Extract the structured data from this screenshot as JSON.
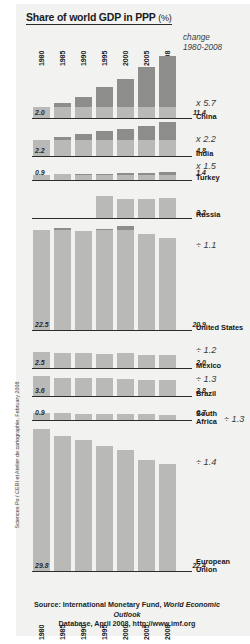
{
  "title": {
    "main": "Share of world GDP in PPP",
    "unit": "(%)"
  },
  "change_header": {
    "line1": "change",
    "line2": "1980-2008"
  },
  "source": {
    "line1_a": "Source: International Monetary Fund, ",
    "line1_b": "World Economic Outlook",
    "line2": "Database, April 2008, http://www.imf.org"
  },
  "credit": "Sciences Po / CERI et Atelier de cartographie, February 2008",
  "colors": {
    "panel": "#f2f2f0",
    "bar": "#b9b9b7",
    "bar_cap": "#8d8d8b",
    "baseline": "#2c2c2c",
    "text": "#141414"
  },
  "chart_data": {
    "type": "bar",
    "title": "Share of world GDP in PPP (%)",
    "xlabel": "",
    "ylabel": "Share of world GDP in PPP (%)",
    "grid": false,
    "legend_position": "none",
    "categories": [
      "1980",
      "1985",
      "1990",
      "1995",
      "2000",
      "2005",
      "2008"
    ],
    "annotation_header": "change 1980-2008",
    "series": [
      {
        "name": "China",
        "values": [
          2.0,
          2.8,
          3.9,
          5.7,
          7.1,
          9.4,
          11.4
        ],
        "start_label": "2.0",
        "end_label": "11.4",
        "change": "x 5.7",
        "change_kind": "increase"
      },
      {
        "name": "India",
        "values": [
          2.2,
          2.7,
          3.1,
          3.5,
          3.8,
          4.3,
          4.8
        ],
        "start_label": "2.2",
        "end_label": "4.8",
        "change": "x 2.2",
        "change_kind": "increase"
      },
      {
        "name": "Turkey",
        "values": [
          0.9,
          1.0,
          1.1,
          1.1,
          1.2,
          1.3,
          1.4
        ],
        "start_label": "0.9",
        "end_label": "1.4",
        "change": "x 1.5",
        "change_kind": "increase"
      },
      {
        "name": "Russia",
        "values": [
          null,
          null,
          null,
          3.6,
          3.1,
          3.1,
          3.2
        ],
        "start_label": "",
        "end_label": "3.2",
        "change": "",
        "change_kind": "none"
      },
      {
        "name": "United States",
        "values": [
          22.5,
          23.0,
          22.4,
          22.9,
          23.5,
          21.6,
          20.9
        ],
        "start_label": "22.5",
        "end_label": "20.9",
        "change": "÷ 1.1",
        "change_kind": "decrease"
      },
      {
        "name": "Mexico",
        "values": [
          2.5,
          2.3,
          2.3,
          2.2,
          2.4,
          2.1,
          2.0
        ],
        "start_label": "2.5",
        "end_label": "2.0",
        "change": "÷ 1.2",
        "change_kind": "decrease"
      },
      {
        "name": "Brazil",
        "values": [
          3.6,
          3.2,
          3.2,
          3.2,
          3.0,
          2.9,
          2.8
        ],
        "start_label": "3.6",
        "end_label": "2.8",
        "change": "÷ 1.3",
        "change_kind": "decrease"
      },
      {
        "name": "South Africa",
        "values": [
          0.9,
          0.85,
          0.82,
          0.78,
          0.75,
          0.72,
          0.7
        ],
        "start_label": "0.9",
        "end_label": "0.7",
        "change": "÷ 1.3",
        "change_kind": "decrease"
      },
      {
        "name": "European Union",
        "values": [
          29.8,
          28.4,
          27.4,
          26.3,
          25.4,
          23.4,
          22.4
        ],
        "start_label": "29.8",
        "end_label": "22.4",
        "change": "÷ 1.4",
        "change_kind": "decrease"
      }
    ]
  },
  "layout": {
    "blocks": [
      {
        "key": "china",
        "baseline_y": 118,
        "height": 62,
        "scale": 5.2,
        "name_y": 113,
        "name_lines": [
          "China"
        ],
        "mult_x": 196,
        "mult_y": 98,
        "start_in": true,
        "end_in": true
      },
      {
        "key": "india",
        "baseline_y": 156,
        "height": 34,
        "scale": 6.6,
        "name_y": 150,
        "name_lines": [
          "India"
        ],
        "mult_x": 196,
        "mult_y": 134,
        "start_in": true,
        "end_in": true
      },
      {
        "key": "turkey",
        "baseline_y": 180,
        "height": 8,
        "scale": 5.6,
        "name_y": 174,
        "name_lines": [
          "Turkey"
        ],
        "mult_x": 196,
        "mult_y": 161,
        "start_in": false,
        "end_in": false
      },
      {
        "key": "russia",
        "baseline_y": 218,
        "height": 22,
        "scale": 6.0,
        "name_y": 211,
        "name_lines": [
          "Russia"
        ],
        "mult_x": 196,
        "mult_y": 203,
        "start_in": false,
        "end_in": true
      },
      {
        "key": "united_states",
        "baseline_y": 330,
        "height": 104,
        "scale": 4.3,
        "name_y": 324,
        "name_lines": [
          "United States"
        ],
        "mult_x": 196,
        "mult_y": 240,
        "start_in": true,
        "end_in": true
      },
      {
        "key": "mexico",
        "baseline_y": 368,
        "height": 16,
        "scale": 6.4,
        "name_y": 362,
        "name_lines": [
          "Mexico"
        ],
        "mult_x": 196,
        "mult_y": 345,
        "start_in": true,
        "end_in": true
      },
      {
        "key": "brazil",
        "baseline_y": 396,
        "height": 20,
        "scale": 5.4,
        "name_y": 390,
        "name_lines": [
          "Brazil"
        ],
        "mult_x": 196,
        "mult_y": 374,
        "start_in": true,
        "end_in": true
      },
      {
        "key": "south_africa",
        "baseline_y": 420,
        "height": 7,
        "scale": 7.0,
        "name_y": 410,
        "name_lines": [
          "South",
          "Africa"
        ],
        "mult_x": 224,
        "mult_y": 414,
        "start_in": false,
        "end_in": false
      },
      {
        "key": "european_union",
        "baseline_y": 571,
        "height": 142,
        "scale": 4.6,
        "name_y": 558,
        "name_lines": [
          "European",
          "Union"
        ],
        "mult_x": 196,
        "mult_y": 457,
        "start_in": true,
        "end_in": true
      }
    ],
    "bar_left": 32,
    "bar_pitch": 21,
    "bar_width": 19,
    "top_years_y": 59,
    "bottom_years_y": 611
  }
}
